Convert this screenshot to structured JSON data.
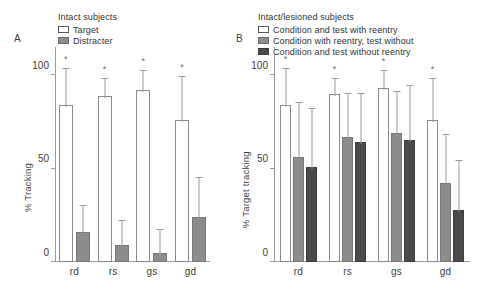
{
  "figure": {
    "panels": [
      {
        "letter": "A",
        "legend_title": "Intact subjects",
        "legend": [
          {
            "label": "Target",
            "swatch": "white"
          },
          {
            "label": "Distracter",
            "swatch": "mid"
          }
        ],
        "ylabel": "% Tracking"
      },
      {
        "letter": "B",
        "legend_title": "Intact/lesioned subjects",
        "legend": [
          {
            "label": "Condition and test with reentry",
            "swatch": "white"
          },
          {
            "label": "Condition with reentry, test without",
            "swatch": "mid"
          },
          {
            "label": "Condition and test without reentry",
            "swatch": "dark"
          }
        ],
        "ylabel": "% Target tracking"
      }
    ]
  },
  "chart_data": [
    {
      "type": "bar",
      "panel": "A",
      "title": "Intact subjects",
      "categories": [
        "rd",
        "rs",
        "gs",
        "gd"
      ],
      "xlabel": "",
      "ylabel": "% Tracking",
      "ylim": [
        0,
        115
      ],
      "yticks": [
        0,
        50,
        100
      ],
      "ytick_labels": [
        "0",
        "50",
        "100"
      ],
      "grid": false,
      "legend_position": "top-left",
      "series": [
        {
          "name": "Target",
          "color": "#ffffff",
          "values": [
            84,
            89,
            92,
            76
          ],
          "error_upper": [
            19,
            9,
            10,
            23
          ],
          "significance": [
            "*",
            "*",
            "*",
            "*"
          ]
        },
        {
          "name": "Distracter",
          "color": "#8d8d8d",
          "values": [
            16,
            9,
            5,
            24
          ],
          "error_upper": [
            14,
            13,
            12,
            21
          ],
          "significance": [
            "",
            "",
            "",
            ""
          ]
        }
      ]
    },
    {
      "type": "bar",
      "panel": "B",
      "title": "Intact/lesioned subjects",
      "categories": [
        "rd",
        "rs",
        "gs",
        "gd"
      ],
      "xlabel": "",
      "ylabel": "% Target tracking",
      "ylim": [
        0,
        115
      ],
      "yticks": [
        0,
        50,
        100
      ],
      "ytick_labels": [
        "0",
        "50",
        "100"
      ],
      "grid": false,
      "legend_position": "top-left",
      "series": [
        {
          "name": "Condition and test with reentry",
          "color": "#ffffff",
          "values": [
            84,
            90,
            93,
            76
          ],
          "error_upper": [
            19,
            8,
            9,
            22
          ],
          "significance": [
            "*",
            "*",
            "*",
            "*"
          ]
        },
        {
          "name": "Condition with reentry, test without",
          "color": "#8d8d8d",
          "values": [
            56,
            67,
            69,
            42
          ],
          "error_upper": [
            29,
            23,
            22,
            26
          ],
          "significance": [
            "",
            "",
            "",
            ""
          ]
        },
        {
          "name": "Condition and test without reentry",
          "color": "#4a4a4a",
          "values": [
            51,
            64,
            65,
            28
          ],
          "error_upper": [
            31,
            26,
            29,
            26
          ],
          "significance": [
            "",
            "",
            "",
            ""
          ]
        }
      ]
    }
  ]
}
